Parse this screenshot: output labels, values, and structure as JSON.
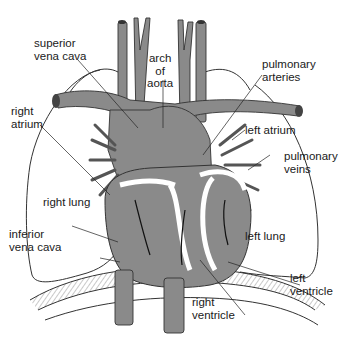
{
  "diagram": {
    "colors": {
      "vessel_fill": "#8a8a8a",
      "vessel_dark": "#5c5c5c",
      "outline": "#222222",
      "background": "#ffffff",
      "chamber_wall": "#ffffff"
    },
    "labels": {
      "superior_vena_cava": "superior\nvena cava",
      "arch_of_aorta": "arch\nof\naorta",
      "pulmonary_arteries": "pulmonary\narteries",
      "right_atrium": "right\natrium",
      "left_atrium": "left atrium",
      "pulmonary_veins": "pulmonary\nveins",
      "right_lung": "right lung",
      "inferior_vena_cava": "inferior\nvena cava",
      "left_lung": "left lung",
      "left_ventricle": "left\nventricle",
      "right_ventricle": "right\nventricle"
    }
  }
}
